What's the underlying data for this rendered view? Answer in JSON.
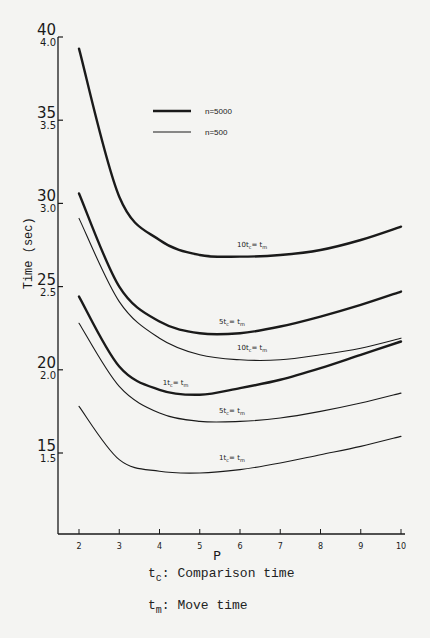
{
  "chart_data": {
    "type": "line",
    "title": "",
    "xlabel": "P",
    "ylabel": "Time (sec)",
    "x": [
      2,
      3,
      4,
      5,
      6,
      7,
      8,
      9,
      10
    ],
    "xlim": [
      1.5,
      10.2
    ],
    "ylim": [
      9,
      40
    ],
    "grid": false,
    "legend_position": "upper-center",
    "yticks": [
      {
        "value": 40,
        "label": "40",
        "sublabel": "4.0"
      },
      {
        "value": 35,
        "label": "35",
        "sublabel": "3.5"
      },
      {
        "value": 30,
        "label": "30",
        "sublabel": "3.0"
      },
      {
        "value": 25,
        "label": "25",
        "sublabel": "2.5"
      },
      {
        "value": 20,
        "label": "20",
        "sublabel": "2.0"
      },
      {
        "value": 15,
        "label": "15",
        "sublabel": "1.5"
      }
    ],
    "xticks": [
      "2",
      "3",
      "4",
      "5",
      "6",
      "7",
      "8",
      "9",
      "10"
    ],
    "legend": [
      {
        "label": "n=5000",
        "style": "heavy"
      },
      {
        "label": "n=500",
        "style": "thin"
      }
    ],
    "series": [
      {
        "name": "n=5000, 10tc = tm",
        "n": 5000,
        "ratio_label": "10t_c = t_m",
        "style": "heavy",
        "values": [
          39.3,
          30.4,
          27.8,
          26.9,
          26.8,
          26.9,
          27.2,
          27.8,
          28.6
        ],
        "label_at": [
          6.3,
          27.2
        ]
      },
      {
        "name": "n=5000, 5tc = tm",
        "n": 5000,
        "ratio_label": "5t_c = t_m",
        "style": "heavy",
        "values": [
          30.6,
          25.0,
          22.9,
          22.2,
          22.2,
          22.6,
          23.2,
          23.9,
          24.7
        ],
        "label_at": [
          5.8,
          22.6
        ]
      },
      {
        "name": "n=500, 10tc = tm",
        "n": 500,
        "ratio_label": "10t_c = t_m",
        "style": "thin",
        "values": [
          29.1,
          24.1,
          21.9,
          20.9,
          20.6,
          20.6,
          20.9,
          21.3,
          21.9
        ],
        "label_at": [
          6.3,
          21.0
        ]
      },
      {
        "name": "n=5000, 1tc = tm",
        "n": 5000,
        "ratio_label": "1t_c = t_m",
        "style": "heavy",
        "values": [
          24.4,
          20.2,
          18.8,
          18.5,
          18.9,
          19.4,
          20.1,
          20.9,
          21.7
        ],
        "label_at": [
          4.4,
          18.9
        ]
      },
      {
        "name": "n=500, 5tc = tm",
        "n": 500,
        "ratio_label": "5t_c = t_m",
        "style": "thin",
        "values": [
          22.8,
          19.0,
          17.4,
          16.9,
          16.9,
          17.1,
          17.5,
          18.0,
          18.6
        ],
        "label_at": [
          5.8,
          17.2
        ]
      },
      {
        "name": "n=500, 1tc = tm",
        "n": 500,
        "ratio_label": "1t_c = t_m",
        "style": "thin",
        "values": [
          17.8,
          14.6,
          13.9,
          13.8,
          14.0,
          14.4,
          14.9,
          15.4,
          16.0
        ],
        "label_at": [
          5.8,
          14.4
        ]
      }
    ],
    "annotations": [
      "t_c: Comparison time",
      "t_m: Move time"
    ]
  },
  "captions": {
    "tc_symbol": "t",
    "tc_sub": "c",
    "tc_text": ": Comparison time",
    "tm_symbol": "t",
    "tm_sub": "m",
    "tm_text": ": Move time"
  },
  "colors": {
    "ink": "#1a1a1a",
    "paper": "#f4f4f2"
  }
}
